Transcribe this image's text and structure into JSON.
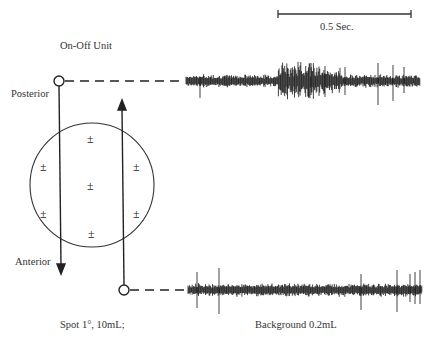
{
  "title": "On-Off Unit",
  "scale_bar": {
    "label": "0.5 Sec."
  },
  "labels": {
    "posterior": "Posterior",
    "anterior": "Anterior",
    "stimulus": "Spot 1°, 10mL;",
    "background": "Background 0.2mL"
  },
  "field_symbol": "±",
  "field_responses": [
    {
      "position": "top",
      "symbol": "±"
    },
    {
      "position": "upper-left",
      "symbol": "±"
    },
    {
      "position": "upper-right",
      "symbol": "±"
    },
    {
      "position": "center",
      "symbol": "±"
    },
    {
      "position": "lower-left",
      "symbol": "±"
    },
    {
      "position": "lower-right",
      "symbol": "±"
    },
    {
      "position": "bottom",
      "symbol": "±"
    }
  ],
  "traces": [
    {
      "name": "posterior-to-anterior sweep",
      "description": "burst of spikes in middle"
    },
    {
      "name": "anterior-to-posterior sweep",
      "description": "sparse spikes"
    }
  ]
}
